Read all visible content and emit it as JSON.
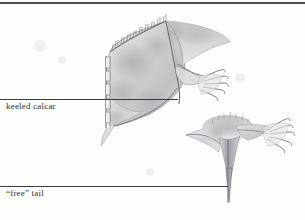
{
  "figure": {
    "background_color": "#fdfdfc",
    "ink_color": "#3a3a40",
    "rule_color": "#4b4b50"
  },
  "top_rule": {
    "present": true,
    "y": 2,
    "width": 305
  },
  "labels": [
    {
      "id": "keeled-calcar",
      "text": "keeled calcar",
      "x": 6,
      "y": 101,
      "leader_line": {
        "x1": 0,
        "y1": 99,
        "x2": 178,
        "y2": 99
      }
    },
    {
      "id": "free-tail",
      "text": "“free” tail",
      "x": 6,
      "y": 188,
      "leader_line": {
        "x1": 0,
        "y1": 186,
        "x2": 228,
        "y2": 186
      }
    }
  ],
  "illustrations": [
    {
      "id": "upper-figure",
      "name": "keeled-calcar-uropatagium",
      "description": "Broad fur-fringed tail membrane spread between hind limb and tail, with a segmented keeled calcar along the left margin and a clawed foot at upper right",
      "bounds": {
        "x": 96,
        "y": 16,
        "width": 128,
        "height": 112
      }
    },
    {
      "id": "lower-figure",
      "name": "free-tail-uropatagium",
      "description": "Narrow tail membrane of a free-tailed bat with the tail projecting well beyond the trailing edge and a clawed foot at right",
      "bounds": {
        "x": 180,
        "y": 112,
        "width": 122,
        "height": 96
      }
    }
  ]
}
